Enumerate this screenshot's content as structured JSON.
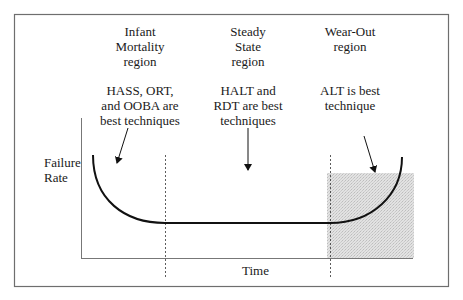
{
  "diagram": {
    "axes": {
      "y_label_line1": "Failure",
      "y_label_line2": "Rate",
      "x_label": "Time"
    },
    "regions": [
      {
        "id": "infant-mortality",
        "title_lines": [
          "Infant",
          "Mortality",
          "region"
        ],
        "technique_lines": [
          "HASS, ORT,",
          "and OOBA are",
          "best techniques"
        ]
      },
      {
        "id": "steady-state",
        "title_lines": [
          "Steady",
          "State",
          "region"
        ],
        "technique_lines": [
          "HALT and",
          "RDT are best",
          "techniques"
        ]
      },
      {
        "id": "wear-out",
        "title_lines": [
          "Wear-Out",
          "region"
        ],
        "technique_lines": [
          "ALT is best",
          "technique"
        ]
      }
    ],
    "colors": {
      "frame": "#6e6e6e",
      "curve": "#111111",
      "shade": "#dcdcdc",
      "divider": "#333333"
    }
  }
}
